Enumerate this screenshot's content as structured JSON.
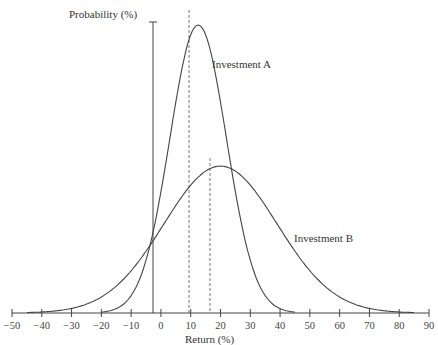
{
  "chart_data": {
    "type": "line",
    "title": "",
    "xlabel": "Return (%)",
    "ylabel": "Probability (%)",
    "xlim": [
      -50,
      90
    ],
    "x_ticks": [
      -50,
      -40,
      -30,
      -20,
      -10,
      0,
      10,
      20,
      30,
      40,
      50,
      60,
      70,
      80,
      90
    ],
    "x_tick_labels": [
      "−50",
      "−40",
      "−30",
      "−20",
      "−10",
      "0",
      "10",
      "20",
      "30",
      "40",
      "50",
      "60",
      "70",
      "80",
      "90"
    ],
    "grid": false,
    "series": [
      {
        "name": "Investment A",
        "distribution": "normal-like",
        "mean": 12.5,
        "support": [
          -20,
          45
        ],
        "relative_peak": 1.0,
        "mean_marker": "dashed"
      },
      {
        "name": "Investment B",
        "distribution": "normal-like",
        "mean": 20,
        "support": [
          -45,
          85
        ],
        "relative_peak": 0.51,
        "mean_marker": "dashed"
      }
    ],
    "annotations": [
      {
        "text": "Investment A",
        "near_x": 22,
        "position": "right of peak A"
      },
      {
        "text": "Investment B",
        "near_x": 55,
        "position": "right tail of B"
      }
    ]
  },
  "labels": {
    "ylabel": "Probability (%)",
    "xlabel": "Return (%)",
    "series_a": "Investment A",
    "series_b": "Investment B"
  },
  "ticks": [
    "−50",
    "−40",
    "−30",
    "−20",
    "−10",
    "0",
    "10",
    "20",
    "30",
    "40",
    "50",
    "60",
    "70",
    "80",
    "90"
  ]
}
